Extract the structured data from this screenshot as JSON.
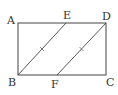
{
  "diagram": {
    "type": "geometry",
    "colors": {
      "stroke": "#444444",
      "label": "#333333",
      "background": "#ffffff"
    },
    "points": {
      "A": {
        "label": "A",
        "x": 18,
        "y": 23
      },
      "B": {
        "label": "B",
        "x": 18,
        "y": 75
      },
      "C": {
        "label": "C",
        "x": 106,
        "y": 75
      },
      "D": {
        "label": "D",
        "x": 106,
        "y": 23
      },
      "E": {
        "label": "E",
        "x": 66,
        "y": 23
      },
      "F": {
        "label": "F",
        "x": 57,
        "y": 75
      }
    },
    "segments": [
      {
        "name": "AB"
      },
      {
        "name": "BC"
      },
      {
        "name": "CD"
      },
      {
        "name": "DA"
      },
      {
        "name": "BE",
        "tick_marks": 1
      },
      {
        "name": "FD",
        "tick_marks": 1
      }
    ],
    "labels": {
      "A": "A",
      "B": "B",
      "C": "C",
      "D": "D",
      "E": "E",
      "F": "F"
    }
  }
}
